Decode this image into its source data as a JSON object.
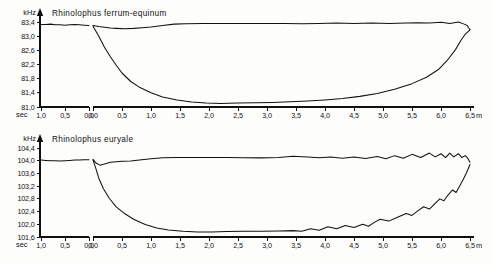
{
  "figure": {
    "unit_y": "kHz",
    "unit_x_left": "sec",
    "unit_x_right": "m"
  },
  "chart_data": [
    {
      "type": "line",
      "title": "Rhinolophus ferrum-equinum",
      "ylabel": "kHz",
      "xlabel": "sec / m",
      "ylim": [
        81.0,
        83.4
      ],
      "yticks": [
        "83,4",
        "83,0",
        "82,6",
        "82,2",
        "81,8",
        "81,4",
        "81,0"
      ],
      "ytick_values": [
        83.4,
        83.0,
        82.6,
        82.2,
        81.8,
        81.4,
        81.0
      ],
      "xticks_left": [
        "1,0",
        "0,5",
        "0,0"
      ],
      "xtick_left_values": [
        -1.0,
        -0.5,
        0.0
      ],
      "xticks_right": [
        "0,0",
        "0,5",
        "1,0",
        "1,5",
        "2,0",
        "2,5",
        "3,0",
        "3,5",
        "4,0",
        "4,5",
        "5,0",
        "5,5",
        "6,0",
        "6,5"
      ],
      "xtick_right_values": [
        0.0,
        0.5,
        1.0,
        1.5,
        2.0,
        2.5,
        3.0,
        3.5,
        4.0,
        4.5,
        5.0,
        5.5,
        6.0,
        6.5
      ],
      "grid": false,
      "legend": "none",
      "series": [
        {
          "name": "pre-event baseline (sec scale)",
          "scale": "left",
          "x": [
            -1.0,
            -0.9,
            -0.8,
            -0.7,
            -0.6,
            -0.5,
            -0.4,
            -0.3,
            -0.2,
            -0.1,
            0.0
          ],
          "values": [
            83.33,
            83.33,
            83.34,
            83.32,
            83.32,
            83.31,
            83.32,
            83.33,
            83.32,
            83.31,
            83.3
          ]
        },
        {
          "name": "upper branch (m scale)",
          "scale": "right",
          "x": [
            0.0,
            0.1,
            0.2,
            0.3,
            0.4,
            0.55,
            0.7,
            0.85,
            1.0,
            1.2,
            1.4,
            1.6,
            1.9,
            2.2,
            2.5,
            2.9,
            3.3,
            3.6,
            3.9,
            4.2,
            4.5,
            4.8,
            5.1,
            5.4,
            5.6,
            5.8,
            6.0,
            6.15,
            6.3,
            6.4,
            6.45,
            6.5
          ],
          "values": [
            83.3,
            83.27,
            83.25,
            83.23,
            83.22,
            83.21,
            83.22,
            83.24,
            83.26,
            83.3,
            83.34,
            83.35,
            83.36,
            83.36,
            83.36,
            83.36,
            83.36,
            83.35,
            83.36,
            83.37,
            83.36,
            83.37,
            83.36,
            83.37,
            83.38,
            83.37,
            83.39,
            83.36,
            83.4,
            83.34,
            83.3,
            83.18
          ]
        },
        {
          "name": "lower branch (m scale)",
          "scale": "right",
          "x": [
            0.0,
            0.1,
            0.2,
            0.3,
            0.4,
            0.5,
            0.65,
            0.8,
            1.0,
            1.2,
            1.45,
            1.7,
            1.95,
            2.2,
            2.5,
            2.8,
            3.1,
            3.4,
            3.7,
            4.0,
            4.3,
            4.6,
            4.9,
            5.2,
            5.5,
            5.75,
            5.95,
            6.1,
            6.25,
            6.35,
            6.42,
            6.5
          ],
          "values": [
            83.28,
            83.0,
            82.68,
            82.42,
            82.18,
            81.96,
            81.72,
            81.56,
            81.4,
            81.28,
            81.2,
            81.14,
            81.11,
            81.1,
            81.11,
            81.12,
            81.13,
            81.15,
            81.17,
            81.2,
            81.24,
            81.3,
            81.38,
            81.5,
            81.66,
            81.84,
            82.05,
            82.3,
            82.62,
            82.9,
            83.06,
            83.18
          ]
        }
      ]
    },
    {
      "type": "line",
      "title": "Rhinolophus euryale",
      "ylabel": "kHz",
      "xlabel": "sec / m",
      "ylim": [
        101.6,
        104.4
      ],
      "yticks": [
        "104,4",
        "104,0",
        "103,6",
        "103,2",
        "102,8",
        "102,4",
        "102,0",
        "101,6"
      ],
      "ytick_values": [
        104.4,
        104.0,
        103.6,
        103.2,
        102.8,
        102.4,
        102.0,
        101.6
      ],
      "xticks_left": [
        "1,0",
        "0,5",
        "0,0"
      ],
      "xtick_left_values": [
        -1.0,
        -0.5,
        0.0
      ],
      "xticks_right": [
        "0,0",
        "0,5",
        "1,0",
        "1,5",
        "2,0",
        "2,5",
        "3,0",
        "3,5",
        "4,0",
        "4,5",
        "5,0",
        "5,5",
        "6,0",
        "6,5"
      ],
      "xtick_right_values": [
        0.0,
        0.5,
        1.0,
        1.5,
        2.0,
        2.5,
        3.0,
        3.5,
        4.0,
        4.5,
        5.0,
        5.5,
        6.0,
        6.5
      ],
      "grid": false,
      "legend": "none",
      "series": [
        {
          "name": "pre-event baseline (sec scale)",
          "scale": "left",
          "x": [
            -1.0,
            -0.9,
            -0.8,
            -0.7,
            -0.6,
            -0.5,
            -0.4,
            -0.3,
            -0.2,
            -0.1,
            0.0
          ],
          "values": [
            104.02,
            104.01,
            104.0,
            104.0,
            103.99,
            104.0,
            104.01,
            104.02,
            104.02,
            104.03,
            104.03
          ]
        },
        {
          "name": "upper branch (m scale)",
          "scale": "right",
          "x": [
            0.0,
            0.05,
            0.12,
            0.2,
            0.3,
            0.4,
            0.5,
            0.65,
            0.8,
            1.0,
            1.2,
            1.45,
            1.7,
            2.0,
            2.3,
            2.6,
            2.9,
            3.2,
            3.45,
            3.7,
            3.9,
            4.1,
            4.3,
            4.5,
            4.7,
            4.9,
            5.05,
            5.2,
            5.35,
            5.5,
            5.65,
            5.8,
            5.9,
            6.0,
            6.08,
            6.15,
            6.22,
            6.3,
            6.36,
            6.42,
            6.46,
            6.5
          ],
          "values": [
            104.04,
            103.93,
            103.86,
            103.9,
            103.95,
            103.97,
            103.98,
            103.99,
            104.02,
            104.06,
            104.09,
            104.1,
            104.1,
            104.1,
            104.1,
            104.09,
            104.09,
            104.1,
            104.14,
            104.12,
            104.09,
            104.12,
            104.08,
            104.12,
            104.07,
            104.13,
            104.06,
            104.16,
            104.08,
            104.2,
            104.1,
            104.24,
            104.12,
            104.22,
            104.1,
            104.24,
            104.12,
            104.22,
            104.1,
            104.16,
            104.08,
            103.95
          ]
        },
        {
          "name": "lower branch (m scale)",
          "scale": "right",
          "x": [
            0.0,
            0.05,
            0.1,
            0.18,
            0.28,
            0.4,
            0.55,
            0.7,
            0.9,
            1.1,
            1.3,
            1.55,
            1.8,
            2.05,
            2.3,
            2.6,
            2.9,
            3.2,
            3.45,
            3.6,
            3.75,
            3.9,
            4.05,
            4.2,
            4.35,
            4.5,
            4.65,
            4.75,
            4.85,
            4.95,
            5.1,
            5.25,
            5.4,
            5.5,
            5.6,
            5.7,
            5.8,
            5.9,
            5.98,
            6.05,
            6.12,
            6.2,
            6.26,
            6.32,
            6.38,
            6.44,
            6.5
          ],
          "values": [
            104.02,
            103.75,
            103.45,
            103.12,
            102.82,
            102.55,
            102.33,
            102.16,
            101.99,
            101.88,
            101.82,
            101.78,
            101.76,
            101.76,
            101.77,
            101.78,
            101.78,
            101.79,
            101.8,
            101.78,
            101.86,
            101.81,
            101.92,
            101.86,
            101.96,
            101.9,
            102.0,
            101.94,
            102.06,
            102.16,
            102.1,
            102.22,
            102.34,
            102.28,
            102.42,
            102.55,
            102.48,
            102.66,
            102.8,
            102.74,
            102.92,
            103.08,
            103.0,
            103.2,
            103.4,
            103.62,
            103.88
          ]
        }
      ]
    }
  ]
}
